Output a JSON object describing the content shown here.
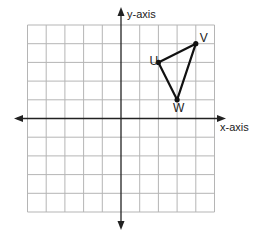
{
  "diagram": {
    "type": "coordinate-grid",
    "x_axis_label": "x-axis",
    "y_axis_label": "y-axis",
    "grid": {
      "xmin": -5,
      "xmax": 5,
      "ymin": -5,
      "ymax": 5,
      "step": 1
    },
    "colors": {
      "grid": "#b5b5b5",
      "axis": "#222222",
      "shape": "#111111"
    },
    "points": [
      {
        "label": "U",
        "x": 2,
        "y": 3
      },
      {
        "label": "V",
        "x": 4,
        "y": 4
      },
      {
        "label": "W",
        "x": 3,
        "y": 1
      }
    ],
    "polygon": [
      "U",
      "V",
      "W"
    ]
  }
}
